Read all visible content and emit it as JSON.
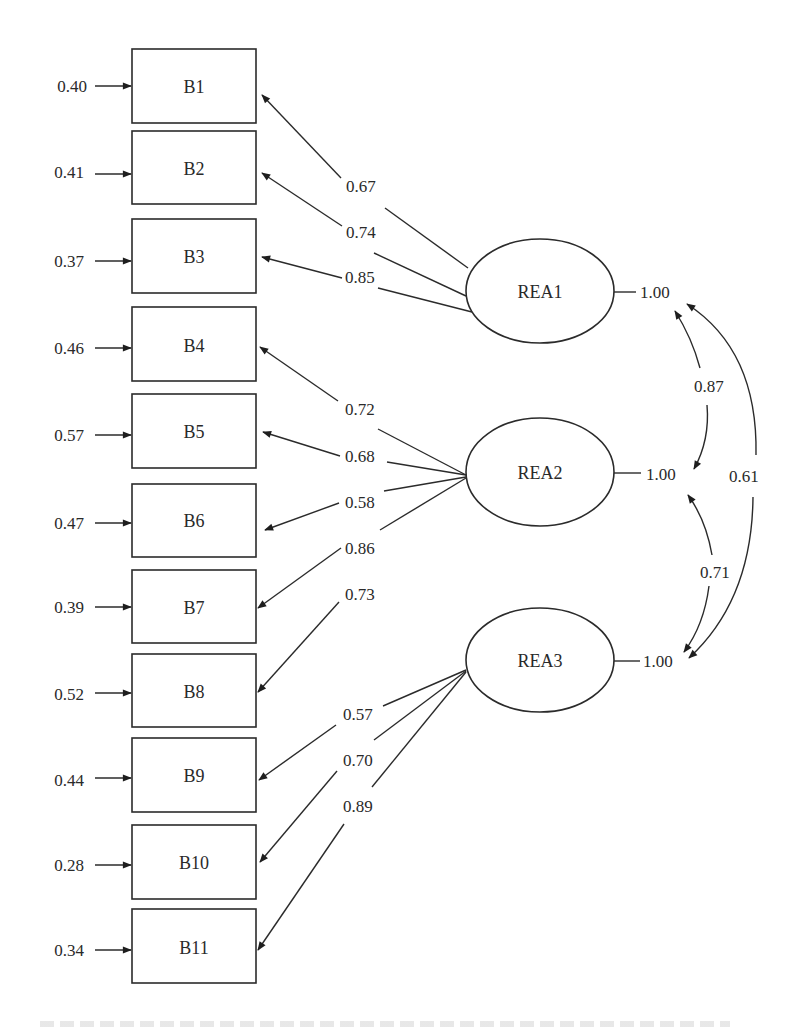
{
  "diagram": {
    "type": "confirmatory factor analysis path diagram",
    "observed": [
      {
        "id": "B1",
        "error": "0.40",
        "y": 86
      },
      {
        "id": "B2",
        "error": "0.41",
        "y": 168
      },
      {
        "id": "B3",
        "error": "0.37",
        "y": 256
      },
      {
        "id": "B4",
        "error": "0.46",
        "y": 344
      },
      {
        "id": "B5",
        "error": "0.57",
        "y": 431
      },
      {
        "id": "B6",
        "error": "0.47",
        "y": 520
      },
      {
        "id": "B7",
        "error": "0.39",
        "y": 607
      },
      {
        "id": "B8",
        "error": "0.52",
        "y": 690
      },
      {
        "id": "B9",
        "error": "0.44",
        "y": 775
      },
      {
        "id": "B10",
        "error": "0.28",
        "y": 862
      },
      {
        "id": "B11",
        "error": "0.34",
        "y": 946
      }
    ],
    "latent": [
      {
        "id": "REA1",
        "variance": "1.00"
      },
      {
        "id": "REA2",
        "variance": "1.00"
      },
      {
        "id": "REA3",
        "variance": "1.00"
      }
    ],
    "loadings": [
      {
        "from": "REA1",
        "to": "B1",
        "value": "0.67"
      },
      {
        "from": "REA1",
        "to": "B2",
        "value": "0.74"
      },
      {
        "from": "REA1",
        "to": "B3",
        "value": "0.85"
      },
      {
        "from": "REA2",
        "to": "B4",
        "value": "0.72"
      },
      {
        "from": "REA2",
        "to": "B5",
        "value": "0.68"
      },
      {
        "from": "REA2",
        "to": "B6",
        "value": "0.58"
      },
      {
        "from": "REA2",
        "to": "B7",
        "value": "0.86"
      },
      {
        "from": "REA2",
        "to": "B8",
        "value": "0.73"
      },
      {
        "from": "REA3",
        "to": "B9",
        "value": "0.57"
      },
      {
        "from": "REA3",
        "to": "B10",
        "value": "0.70"
      },
      {
        "from": "REA3",
        "to": "B11",
        "value": "0.89"
      }
    ],
    "covariances": [
      {
        "between": [
          "REA1",
          "REA2"
        ],
        "value": "0.87"
      },
      {
        "between": [
          "REA2",
          "REA3"
        ],
        "value": "0.71"
      },
      {
        "between": [
          "REA1",
          "REA3"
        ],
        "value": "0.61"
      }
    ]
  }
}
